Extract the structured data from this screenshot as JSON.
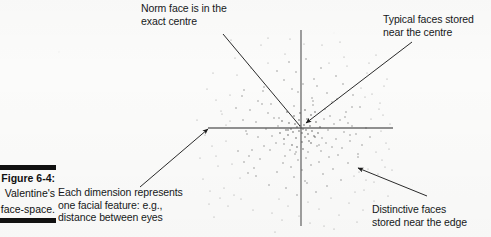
{
  "figure": {
    "caption_number": "Figure 6-4:",
    "caption_line1": "Valentine's",
    "caption_line2": "face-space.",
    "ink_color": "#1b1b1b",
    "background_color": "#fbfbfa"
  },
  "annotations": {
    "norm_face": "Norm face is in the\nexact centre",
    "typical_faces": "Typical faces stored\nnear the centre",
    "dimension": "Each dimension represents\none facial feature: e.g.,\ndistance between eyes",
    "distinctive_faces": "Distinctive faces\nstored near the edge"
  },
  "chart_data": {
    "type": "scatter",
    "title": "Valentine's face-space",
    "xlabel": "",
    "ylabel": "",
    "xlim": [
      -1,
      1
    ],
    "ylim": [
      -1,
      1
    ],
    "grid": false,
    "legend": null,
    "axes": {
      "style": "crosshair through origin",
      "x_axis": {
        "x1": 208,
        "y1": 128,
        "x2": 393,
        "y2": 128
      },
      "y_axis": {
        "x1": 301,
        "y1": 30,
        "x2": 301,
        "y2": 226
      },
      "origin": {
        "x": 301,
        "y": 128
      },
      "color": "#6b6b6b"
    },
    "distribution": "bivariate gaussian centred on origin, dense core, sparse periphery",
    "point_count": 236,
    "point_color": "#4a4a4a",
    "points": [
      [
        301,
        128
      ],
      [
        300,
        126
      ],
      [
        303,
        129
      ],
      [
        299,
        131
      ],
      [
        304,
        125
      ],
      [
        297,
        127
      ],
      [
        302,
        133
      ],
      [
        306,
        130
      ],
      [
        295,
        124
      ],
      [
        308,
        134
      ],
      [
        293,
        132
      ],
      [
        310,
        126
      ],
      [
        299,
        120
      ],
      [
        305,
        137
      ],
      [
        291,
        129
      ],
      [
        312,
        131
      ],
      [
        296,
        138
      ],
      [
        307,
        119
      ],
      [
        289,
        123
      ],
      [
        314,
        136
      ],
      [
        302,
        142
      ],
      [
        288,
        135
      ],
      [
        316,
        122
      ],
      [
        294,
        116
      ],
      [
        309,
        141
      ],
      [
        286,
        130
      ],
      [
        318,
        133
      ],
      [
        300,
        113
      ],
      [
        311,
        115
      ],
      [
        284,
        139
      ],
      [
        320,
        127
      ],
      [
        292,
        145
      ],
      [
        305,
        110
      ],
      [
        282,
        121
      ],
      [
        322,
        138
      ],
      [
        297,
        147
      ],
      [
        315,
        112
      ],
      [
        280,
        133
      ],
      [
        324,
        119
      ],
      [
        303,
        149
      ],
      [
        287,
        112
      ],
      [
        326,
        143
      ],
      [
        290,
        150
      ],
      [
        317,
        146
      ],
      [
        278,
        126
      ],
      [
        328,
        130
      ],
      [
        308,
        152
      ],
      [
        276,
        143
      ],
      [
        330,
        116
      ],
      [
        295,
        154
      ],
      [
        313,
        105
      ],
      [
        274,
        118
      ],
      [
        332,
        147
      ],
      [
        285,
        156
      ],
      [
        321,
        151
      ],
      [
        272,
        136
      ],
      [
        334,
        124
      ],
      [
        306,
        158
      ],
      [
        270,
        150
      ],
      [
        336,
        139
      ],
      [
        298,
        160
      ],
      [
        325,
        109
      ],
      [
        268,
        113
      ],
      [
        338,
        155
      ],
      [
        283,
        163
      ],
      [
        319,
        162
      ],
      [
        266,
        129
      ],
      [
        340,
        120
      ],
      [
        311,
        165
      ],
      [
        264,
        146
      ],
      [
        342,
        148
      ],
      [
        291,
        167
      ],
      [
        329,
        157
      ],
      [
        262,
        104
      ],
      [
        344,
        132
      ],
      [
        302,
        170
      ],
      [
        260,
        159
      ],
      [
        346,
        112
      ],
      [
        277,
        172
      ],
      [
        323,
        174
      ],
      [
        258,
        137
      ],
      [
        348,
        163
      ],
      [
        313,
        101
      ],
      [
        256,
        122
      ],
      [
        350,
        141
      ],
      [
        294,
        177
      ],
      [
        333,
        169
      ],
      [
        254,
        168
      ],
      [
        352,
        126
      ],
      [
        305,
        181
      ],
      [
        269,
        185
      ],
      [
        337,
        99
      ],
      [
        252,
        150
      ],
      [
        354,
        176
      ],
      [
        286,
        188
      ],
      [
        327,
        186
      ],
      [
        250,
        110
      ],
      [
        356,
        134
      ],
      [
        316,
        192
      ],
      [
        248,
        173
      ],
      [
        358,
        157
      ],
      [
        297,
        195
      ],
      [
        341,
        180
      ],
      [
        246,
        131
      ],
      [
        360,
        107
      ],
      [
        279,
        199
      ],
      [
        331,
        198
      ],
      [
        244,
        162
      ],
      [
        362,
        145
      ],
      [
        308,
        202
      ],
      [
        242,
        96
      ],
      [
        364,
        190
      ],
      [
        288,
        206
      ],
      [
        345,
        117
      ],
      [
        240,
        178
      ],
      [
        366,
        128
      ],
      [
        319,
        209
      ],
      [
        238,
        151
      ],
      [
        368,
        169
      ],
      [
        272,
        213
      ],
      [
        349,
        203
      ],
      [
        236,
        108
      ],
      [
        370,
        137
      ],
      [
        299,
        216
      ],
      [
        234,
        195
      ],
      [
        372,
        94
      ],
      [
        282,
        220
      ],
      [
        339,
        215
      ],
      [
        232,
        164
      ],
      [
        374,
        182
      ],
      [
        310,
        223
      ],
      [
        230,
        121
      ],
      [
        376,
        152
      ],
      [
        263,
        91
      ],
      [
        353,
        95
      ],
      [
        228,
        206
      ],
      [
        378,
        174
      ],
      [
        292,
        89
      ],
      [
        226,
        141
      ],
      [
        380,
        103
      ],
      [
        324,
        226
      ],
      [
        224,
        188
      ],
      [
        382,
        160
      ],
      [
        253,
        210
      ],
      [
        357,
        222
      ],
      [
        222,
        114
      ],
      [
        384,
        86
      ],
      [
        303,
        84
      ],
      [
        220,
        198
      ],
      [
        386,
        143
      ],
      [
        275,
        232
      ],
      [
        343,
        84
      ],
      [
        218,
        166
      ],
      [
        388,
        196
      ],
      [
        334,
        229
      ],
      [
        216,
        100
      ],
      [
        390,
        124
      ],
      [
        243,
        120
      ],
      [
        363,
        210
      ],
      [
        214,
        217
      ],
      [
        392,
        170
      ],
      [
        284,
        80
      ],
      [
        212,
        146
      ],
      [
        367,
        73
      ],
      [
        314,
        79
      ],
      [
        210,
        191
      ],
      [
        237,
        75
      ],
      [
        355,
        192
      ],
      [
        321,
        68
      ],
      [
        268,
        63
      ],
      [
        296,
        72
      ],
      [
        347,
        66
      ],
      [
        230,
        95
      ],
      [
        371,
        119
      ],
      [
        205,
        135
      ],
      [
        258,
        101
      ],
      [
        361,
        88
      ],
      [
        289,
        62
      ],
      [
        336,
        76
      ],
      [
        249,
        156
      ],
      [
        379,
        109
      ],
      [
        213,
        73
      ],
      [
        327,
        93
      ],
      [
        277,
        71
      ],
      [
        366,
        180
      ],
      [
        203,
        179
      ],
      [
        241,
        199
      ],
      [
        352,
        107
      ],
      [
        306,
        59
      ],
      [
        385,
        167
      ],
      [
        221,
        111
      ],
      [
        317,
        86
      ],
      [
        264,
        87
      ],
      [
        374,
        201
      ],
      [
        200,
        158
      ],
      [
        247,
        134
      ],
      [
        358,
        154
      ],
      [
        285,
        54
      ],
      [
        332,
        102
      ],
      [
        209,
        204
      ],
      [
        369,
        63
      ],
      [
        298,
        92
      ],
      [
        256,
        176
      ],
      [
        381,
        131
      ],
      [
        226,
        125
      ],
      [
        344,
        57
      ],
      [
        312,
        98
      ],
      [
        235,
        58
      ],
      [
        389,
        149
      ],
      [
        271,
        104
      ],
      [
        350,
        135
      ],
      [
        207,
        89
      ],
      [
        322,
        45
      ],
      [
        290,
        39
      ],
      [
        261,
        45
      ],
      [
        376,
        55
      ],
      [
        231,
        40
      ],
      [
        340,
        42
      ],
      [
        304,
        44
      ],
      [
        197,
        120
      ],
      [
        387,
        79
      ],
      [
        279,
        118
      ],
      [
        365,
        97
      ],
      [
        251,
        68
      ],
      [
        216,
        156
      ],
      [
        329,
        63
      ],
      [
        294,
        106
      ],
      [
        359,
        172
      ],
      [
        244,
        90
      ],
      [
        383,
        115
      ],
      [
        268,
        38
      ],
      [
        348,
        123
      ],
      [
        307,
        183
      ],
      [
        288,
        130
      ],
      [
        311,
        143
      ],
      [
        296,
        152
      ],
      [
        315,
        137
      ],
      [
        284,
        144
      ],
      [
        319,
        145
      ]
    ],
    "callouts": [
      {
        "name": "norm-face",
        "text": "Norm face is in the exact centre",
        "line": {
          "x1": 223,
          "y1": 34,
          "x2": 300,
          "y2": 126
        },
        "arrow": false
      },
      {
        "name": "typical-faces",
        "text": "Typical faces stored near the centre",
        "line": {
          "x1": 412,
          "y1": 42,
          "x2": 306,
          "y2": 123
        },
        "arrow": true
      },
      {
        "name": "each-dimension",
        "text": "Each dimension represents one facial feature: e.g., distance between eyes",
        "line": {
          "x1": 140,
          "y1": 187,
          "x2": 208,
          "y2": 129
        },
        "arrow": true
      },
      {
        "name": "distinctive-faces",
        "text": "Distinctive faces stored near the edge",
        "line": {
          "x1": 427,
          "y1": 196,
          "x2": 358,
          "y2": 168
        },
        "arrow": true
      }
    ]
  }
}
